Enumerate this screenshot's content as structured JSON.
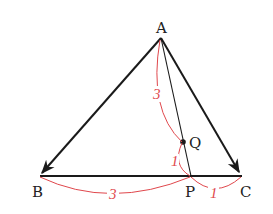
{
  "diagram": {
    "type": "triangle-vector-ratio",
    "points": {
      "A": {
        "label": "A",
        "x": 161,
        "y": 38
      },
      "B": {
        "label": "B",
        "x": 40,
        "y": 175
      },
      "C": {
        "label": "C",
        "x": 241,
        "y": 175
      },
      "P": {
        "label": "P",
        "x": 191,
        "y": 176
      },
      "Q": {
        "label": "Q",
        "x": 183,
        "y": 142
      }
    },
    "vectors": [
      "AB",
      "AC"
    ],
    "segments": [
      "BC",
      "AP"
    ],
    "ratios": {
      "AQ": "3",
      "QP": "1",
      "BP": "3",
      "PC": "1"
    },
    "colors": {
      "lines": "#1a1a1a",
      "ratio_marks": "#e0474c"
    }
  }
}
